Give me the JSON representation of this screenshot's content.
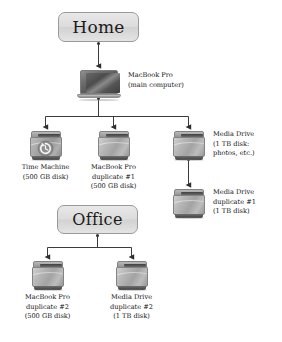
{
  "diagram": {
    "type": "backup-topology-tree",
    "title_nodes": [
      {
        "id": "home",
        "label": "Home"
      },
      {
        "id": "office",
        "label": "Office"
      }
    ],
    "nodes": [
      {
        "id": "macbook-pro-main",
        "icon": "laptop-icon",
        "lines": [
          "MacBook Pro",
          "(main computer)"
        ],
        "label_position": "right"
      },
      {
        "id": "time-machine",
        "icon": "time-machine-drive-icon",
        "lines": [
          "Time Machine",
          "(500 GB disk)"
        ],
        "label_position": "below"
      },
      {
        "id": "macbook-pro-duplicate-1",
        "icon": "hard-drive-icon",
        "lines": [
          "MacBook Pro",
          "duplicate #1",
          "(500 GB disk)"
        ],
        "label_position": "below"
      },
      {
        "id": "media-drive",
        "icon": "hard-drive-icon",
        "lines": [
          "Media Drive",
          "(1 TB disk:",
          "photos, etc.)"
        ],
        "label_position": "right"
      },
      {
        "id": "media-drive-duplicate-1",
        "icon": "hard-drive-icon",
        "lines": [
          "Media Drive",
          "duplicate #1",
          "(1 TB disk)"
        ],
        "label_position": "right"
      },
      {
        "id": "macbook-pro-duplicate-2",
        "icon": "hard-drive-icon",
        "lines": [
          "MacBook Pro",
          "duplicate #2",
          "(500 GB disk)"
        ],
        "label_position": "below"
      },
      {
        "id": "media-drive-duplicate-2",
        "icon": "hard-drive-icon",
        "lines": [
          "Media Drive",
          "duplicate #2",
          "(1 TB disk)"
        ],
        "label_position": "below"
      }
    ],
    "edges": [
      {
        "from": "home",
        "to": "macbook-pro-main"
      },
      {
        "from": "macbook-pro-main",
        "to": "time-machine"
      },
      {
        "from": "macbook-pro-main",
        "to": "macbook-pro-duplicate-1"
      },
      {
        "from": "macbook-pro-main",
        "to": "media-drive"
      },
      {
        "from": "media-drive",
        "to": "media-drive-duplicate-1"
      },
      {
        "from": "office",
        "to": "macbook-pro-duplicate-2"
      },
      {
        "from": "office",
        "to": "media-drive-duplicate-2"
      }
    ],
    "colors": {
      "background": "#ffffff",
      "box_fill": "#dcdcdc",
      "box_border": "#9a9a9a",
      "connector": "#3b3b3b",
      "text": "#141414"
    }
  }
}
